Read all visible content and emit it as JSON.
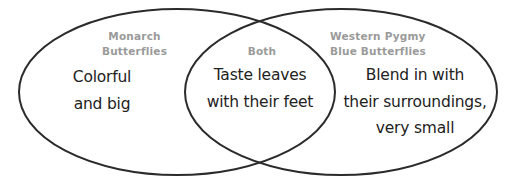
{
  "diagram": {
    "type": "venn",
    "left_set": {
      "title_lines": [
        "Monarch",
        "Butterflies"
      ],
      "text_lines": [
        "Colorful",
        "and big"
      ]
    },
    "intersection": {
      "title_lines": [
        "Both"
      ],
      "text_lines": [
        "Taste leaves",
        "with their feet"
      ]
    },
    "right_set": {
      "title_lines": [
        "Western Pygmy",
        "Blue Butterflies"
      ],
      "text_lines": [
        "Blend in with",
        "their surroundings,",
        "very small"
      ]
    },
    "colors": {
      "outline": "#2b2b2b",
      "title": "#9a9a9a",
      "text": "#222222",
      "background": "#ffffff"
    }
  }
}
